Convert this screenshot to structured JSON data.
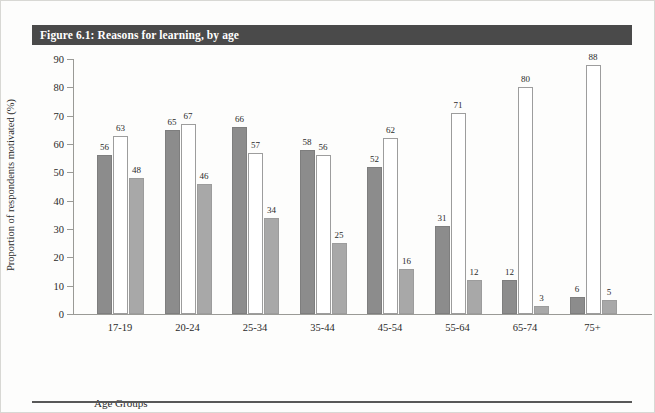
{
  "figure": {
    "title": "Figure 6.1: Reasons for learning, by age",
    "title_bar_color": "#4a4a4a"
  },
  "chart_data": {
    "type": "bar",
    "title": "Figure 6.1: Reasons for learning, by age",
    "xlabel": "Age Groups",
    "ylabel": "Proportion of respondents motivated (%)",
    "ylim": [
      0,
      90
    ],
    "yticks": [
      0,
      10,
      20,
      30,
      40,
      50,
      60,
      70,
      80,
      90
    ],
    "grid": false,
    "legend_position": "bottom",
    "categories": [
      "17-19",
      "20-24",
      "25-34",
      "35-44",
      "45-54",
      "55-64",
      "65-74",
      "75+"
    ],
    "series": [
      {
        "name": "work related reasons",
        "color": "#8c8c8c",
        "values": [
          56,
          65,
          66,
          58,
          52,
          31,
          12,
          6
        ]
      },
      {
        "name": "personal development reasons",
        "color": "#ffffff",
        "values": [
          63,
          67,
          57,
          56,
          62,
          71,
          80,
          88
        ]
      },
      {
        "name": "education/progression reasons",
        "color": "#a8a8a8",
        "values": [
          48,
          46,
          34,
          25,
          16,
          12,
          3,
          5
        ]
      }
    ]
  }
}
